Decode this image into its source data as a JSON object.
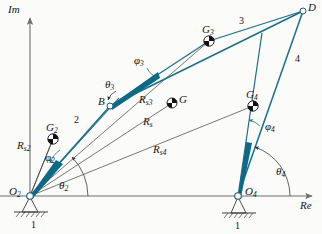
{
  "figure": {
    "type": "fourbar-linkage-vector-diagram",
    "axes": {
      "imaginary": "Im",
      "real": "Re"
    },
    "colors": {
      "link": "#1a6e87",
      "link_fill": "#0d6a86",
      "vector": "#5a5a5a",
      "axis": "#6e6e6e",
      "text": "#151515",
      "background": "#fbfbf9",
      "ground_hatch": "#4a4a4a"
    },
    "joints": [
      {
        "name": "O2",
        "base": "O",
        "sub": "2",
        "x": 30,
        "y": 196,
        "kind": "ground-pivot"
      },
      {
        "name": "A",
        "base": "",
        "sub": "",
        "x": 110,
        "y": 106,
        "kind": "pin"
      },
      {
        "name": "B",
        "base": "B",
        "sub": "",
        "x": 110,
        "y": 106,
        "kind": "pin"
      },
      {
        "name": "D",
        "base": "D",
        "sub": "",
        "x": 303,
        "y": 11,
        "kind": "pin"
      },
      {
        "name": "O4",
        "base": "O",
        "sub": "4",
        "x": 238,
        "y": 196,
        "kind": "ground-pivot"
      }
    ],
    "mass_centers": [
      {
        "name": "G2",
        "base": "G",
        "sub": "2",
        "x": 53,
        "y": 139
      },
      {
        "name": "G3",
        "base": "G",
        "sub": "3",
        "x": 209,
        "y": 41
      },
      {
        "name": "G4",
        "base": "G",
        "sub": "4",
        "x": 253,
        "y": 106
      },
      {
        "name": "G",
        "base": "G",
        "sub": "",
        "x": 172,
        "y": 103
      }
    ],
    "link_numbers": [
      {
        "label": "1",
        "x": 34,
        "y": 222
      },
      {
        "label": "1",
        "x": 238,
        "y": 224
      },
      {
        "label": "2",
        "x": 76,
        "y": 122
      },
      {
        "label": "3",
        "x": 241,
        "y": 23
      },
      {
        "label": "4",
        "x": 297,
        "y": 60
      }
    ],
    "vector_labels": [
      {
        "name": "R_s2",
        "base": "R",
        "sub": "s2",
        "x": 24,
        "y": 147
      },
      {
        "name": "R_s3",
        "base": "R",
        "sub": "s3",
        "x": 145,
        "y": 101
      },
      {
        "name": "R_s",
        "base": "R",
        "sub": "s",
        "x": 148,
        "y": 123
      },
      {
        "name": "R_s4",
        "base": "R",
        "sub": "s4",
        "x": 160,
        "y": 151
      }
    ],
    "angle_labels": [
      {
        "name": "theta_2",
        "base": "θ",
        "sub": "2",
        "x": 62,
        "y": 186
      },
      {
        "name": "theta_3",
        "base": "θ",
        "sub": "3",
        "x": 110,
        "y": 86
      },
      {
        "name": "theta_4",
        "base": "θ",
        "sub": "4",
        "x": 279,
        "y": 172
      },
      {
        "name": "phi_2",
        "base": "φ",
        "sub": "2",
        "x": 49,
        "y": 159
      },
      {
        "name": "phi_3",
        "base": "φ",
        "sub": "3",
        "x": 139,
        "y": 62
      },
      {
        "name": "phi_4",
        "base": "φ",
        "sub": "4",
        "x": 268,
        "y": 127
      }
    ],
    "axis_labels": [
      {
        "name": "im-axis-label",
        "text": "Im",
        "x": 8,
        "y": 6
      },
      {
        "name": "re-axis-label",
        "text": "Re",
        "x": 300,
        "y": 203
      }
    ]
  }
}
